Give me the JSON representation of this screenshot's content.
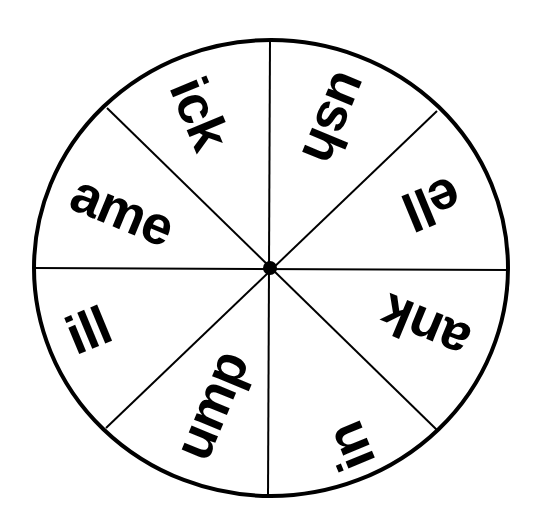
{
  "wheel": {
    "title": "Word family spinner",
    "center": {
      "x": 271,
      "y": 268
    },
    "radius_x": 238,
    "radius_y": 229,
    "stroke_color": "#000000",
    "fill_color": "#ffffff",
    "sector_count": 8,
    "divider_angles_deg": [
      0,
      45,
      90,
      135,
      180,
      225,
      270,
      315
    ],
    "sectors": [
      {
        "label": "ick",
        "x": 200,
        "y": 113,
        "rotate_deg": 67.5
      },
      {
        "label": "ush",
        "x": 336,
        "y": 118,
        "rotate_deg": 112.5
      },
      {
        "label": "ell",
        "x": 432,
        "y": 204,
        "rotate_deg": 157.5
      },
      {
        "label": "ank",
        "x": 425,
        "y": 328,
        "rotate_deg": 202.5
      },
      {
        "label": "in",
        "x": 350,
        "y": 447,
        "rotate_deg": 247.5
      },
      {
        "label": "ump",
        "x": 210,
        "y": 405,
        "rotate_deg": 292.5
      },
      {
        "label": "ill",
        "x": 88,
        "y": 330,
        "rotate_deg": 337.5
      },
      {
        "label": "ame",
        "x": 122,
        "y": 210,
        "rotate_deg": 22.5
      }
    ]
  }
}
